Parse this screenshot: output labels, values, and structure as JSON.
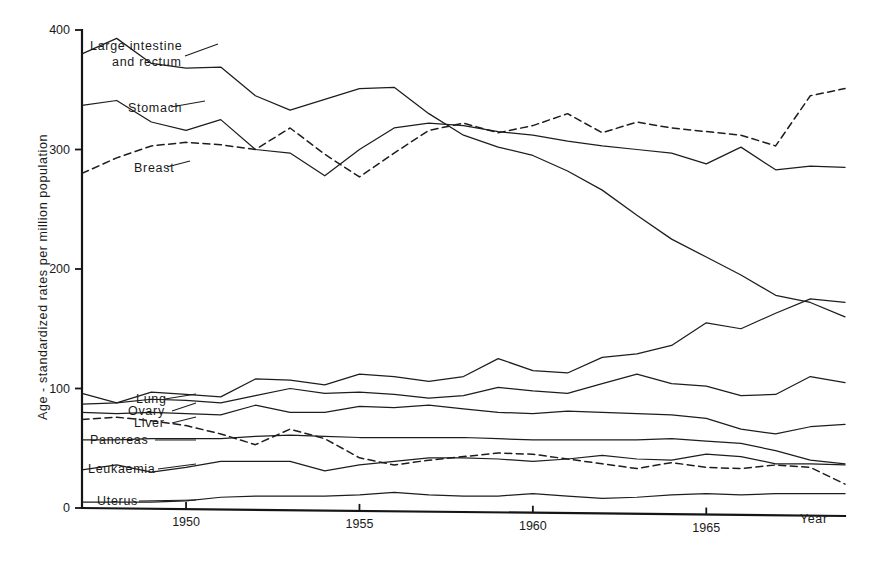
{
  "chart_data": {
    "type": "line",
    "title": "",
    "xlabel": "Year",
    "ylabel": "Age - standardized rates per million population",
    "xlim": [
      1947,
      1969
    ],
    "ylim": [
      0,
      400
    ],
    "grid": false,
    "legend_position": "inline-labels-left",
    "x_tick_labels": [
      "1950",
      "1955",
      "1960",
      "1965"
    ],
    "x_tick_values": [
      1950,
      1955,
      1960,
      1965
    ],
    "y_tick_labels": [
      "0",
      "100",
      "200",
      "300",
      "400"
    ],
    "y_tick_values": [
      0,
      100,
      200,
      300,
      400
    ],
    "x": [
      1947,
      1948,
      1949,
      1950,
      1951,
      1952,
      1953,
      1954,
      1955,
      1956,
      1957,
      1958,
      1959,
      1960,
      1961,
      1962,
      1963,
      1964,
      1965,
      1966,
      1967,
      1968,
      1969
    ],
    "series": [
      {
        "name": "Large intestine and rectum",
        "label": "Large intestine\nand rectum",
        "style": "solid",
        "color": "#1d1d1d",
        "values": [
          380,
          393,
          372,
          368,
          369,
          345,
          333,
          342,
          351,
          352,
          330,
          312,
          302,
          295,
          282,
          266,
          245,
          225,
          210,
          195,
          178,
          172,
          160
        ]
      },
      {
        "name": "Stomach",
        "label": "Stomach",
        "style": "solid",
        "color": "#1d1d1d",
        "values": [
          337,
          341,
          323,
          316,
          325,
          300,
          297,
          278,
          300,
          318,
          322,
          320,
          315,
          312,
          307,
          303,
          300,
          297,
          288,
          302,
          283,
          286,
          285
        ]
      },
      {
        "name": "Breast",
        "label": "Breast",
        "style": "dashed",
        "color": "#1d1d1d",
        "values": [
          280,
          293,
          303,
          306,
          304,
          300,
          318,
          296,
          277,
          297,
          316,
          322,
          314,
          320,
          330,
          314,
          323,
          318,
          315,
          312,
          303,
          345,
          351
        ]
      },
      {
        "name": "Unlabelled rising series",
        "label": "",
        "style": "solid",
        "color": "#1d1d1d",
        "values": [
          96,
          88,
          97,
          95,
          93,
          108,
          107,
          103,
          112,
          110,
          106,
          110,
          125,
          115,
          113,
          126,
          129,
          136,
          155,
          150,
          163,
          175,
          172
        ]
      },
      {
        "name": "Lung",
        "label": "Lung",
        "style": "solid",
        "color": "#1d1d1d",
        "values": [
          87,
          88,
          91,
          90,
          88,
          94,
          100,
          96,
          97,
          95,
          92,
          94,
          101,
          98,
          96,
          104,
          112,
          104,
          102,
          94,
          95,
          110,
          105
        ]
      },
      {
        "name": "Ovary",
        "label": "Ovary",
        "style": "solid",
        "color": "#1d1d1d",
        "values": [
          80,
          79,
          80,
          79,
          78,
          86,
          80,
          80,
          85,
          84,
          86,
          83,
          80,
          79,
          81,
          80,
          79,
          78,
          75,
          66,
          62,
          68,
          70
        ]
      },
      {
        "name": "Liver",
        "label": "Liver",
        "style": "dashed",
        "color": "#1d1d1d",
        "values": [
          74,
          76,
          73,
          69,
          62,
          53,
          66,
          58,
          42,
          36,
          40,
          43,
          46,
          45,
          41,
          37,
          33,
          38,
          34,
          33,
          36,
          34,
          20
        ]
      },
      {
        "name": "Pancreas",
        "label": "Pancreas",
        "style": "solid",
        "color": "#1d1d1d",
        "values": [
          57,
          57,
          58,
          58,
          58,
          60,
          61,
          60,
          59,
          59,
          59,
          59,
          58,
          57,
          57,
          57,
          57,
          58,
          56,
          54,
          48,
          40,
          37
        ]
      },
      {
        "name": "Leukaemia",
        "label": "Leukaemia",
        "style": "solid",
        "color": "#1d1d1d",
        "values": [
          32,
          36,
          30,
          34,
          39,
          39,
          39,
          31,
          36,
          39,
          42,
          42,
          41,
          39,
          41,
          44,
          41,
          40,
          45,
          43,
          37,
          37,
          36
        ]
      },
      {
        "name": "Uterus",
        "label": "Uterus",
        "style": "solid",
        "color": "#1d1d1d",
        "values": [
          5,
          5,
          5,
          6,
          9,
          10,
          10,
          10,
          11,
          13,
          11,
          10,
          10,
          12,
          10,
          8,
          9,
          11,
          12,
          11,
          12,
          12,
          12
        ]
      }
    ]
  },
  "axes": {
    "x_axis_title": "Year",
    "y_axis_title": "Age - standardized rates per million population"
  },
  "labels": {
    "large_intestine_line1": "Large  intestine",
    "large_intestine_line2": "and   rectum",
    "stomach": "Stomach",
    "breast": "Breast",
    "lung": "Lung",
    "ovary": "Ovary",
    "liver": "Liver",
    "pancreas": "Pancreas",
    "leukaemia": "Leukaemia",
    "uterus": "Uterus"
  },
  "ticks": {
    "y": [
      "400",
      "300",
      "200",
      "100",
      "0"
    ],
    "x": [
      "1950",
      "1955",
      "1960",
      "1965"
    ]
  },
  "style": {
    "line_color": "#1d1d1d",
    "axis_color": "#151515",
    "background": "#ffffff"
  }
}
